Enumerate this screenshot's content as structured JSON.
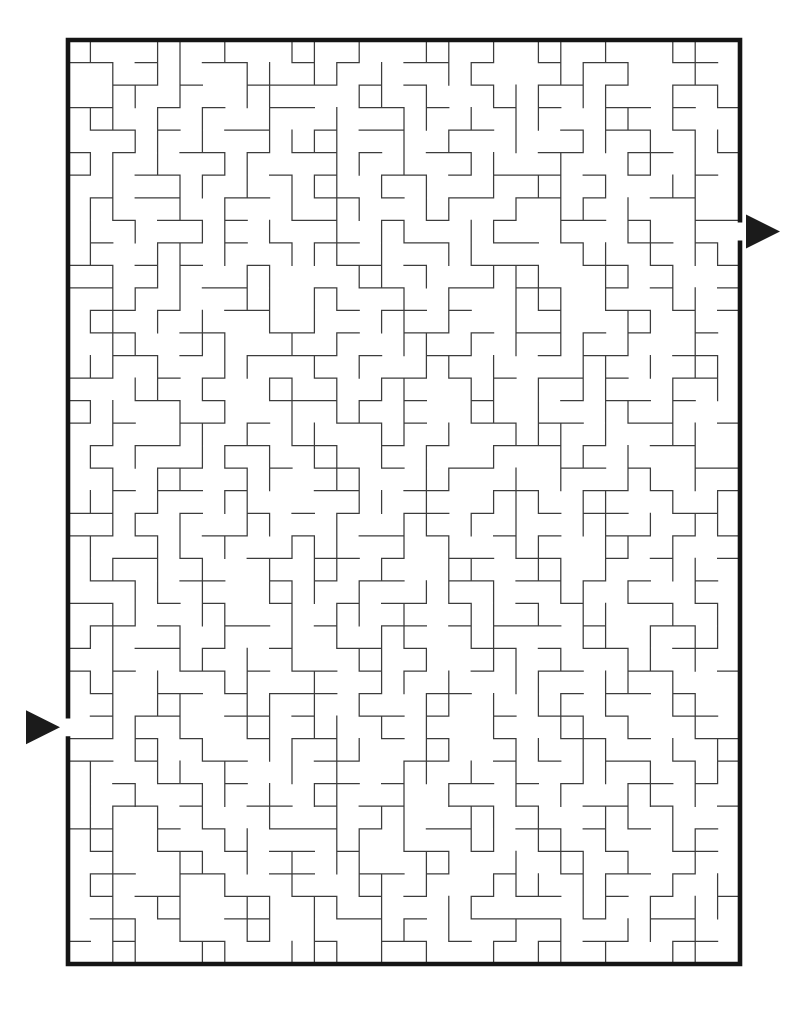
{
  "page": {
    "background": "#ffffff"
  },
  "maze": {
    "grid": {
      "cols": 30,
      "rows": 41
    },
    "frame": {
      "x": 68,
      "y": 40,
      "width": 672,
      "height": 924
    },
    "border": {
      "color": "#151515",
      "width": 4.6
    },
    "wall": {
      "color": "#3c3c3c",
      "width": 1.25
    },
    "entrance": {
      "side": "left",
      "row": 30,
      "direction": "right"
    },
    "exit": {
      "side": "right",
      "row": 8,
      "direction": "right"
    },
    "arrow_color": "#1b1b1b",
    "hwalls": [
      "110100110010100110100101100110",
      "001101001111010100100110100110",
      "110010100110011010010100110101",
      "011010011001011001100010110100",
      "101001101011010011000110011001",
      "100110100101001101011101010010",
      "010110011001101001101101001100",
      "001011010011001010010011010011",
      "010011010101100110011010011010",
      "110101001000110100111001101001",
      "110100110001011001101100101001",
      "011010011000101101000100110101",
      "011001100110100110101101010010",
      "001101001111010011000101100110",
      "110010100101001101010110100110",
      "100110100111010100100010110100",
      "101001101000110100110110011001",
      "010110011011001010011101001100",
      "010011010101101001100011010011",
      "001011010001100110011001101001",
      "110101001010100110100101100110",
      "110100110010011010010100110101",
      "001101001101101001101100101001",
      "011001100101011001101101010010",
      "110010100100101101001010011010",
      "011010011001001101011101001100",
      "100110100100110100110101100110",
      "101001101011010100100110011001",
      "010011010111010011000010110100",
      "010110011010011010010110100110",
      "110101001011001010010011010011",
      "110100110001100110010100110101",
      "001011010001101001101010011010",
      "001101001101011001101001101001",
      "110010100111010011001101010010",
      "010011010110100110100110100110",
      "011001100110011010010010110100",
      "010110011011010100101100101001",
      "011010011000110100111101001100",
      "101001101001001101010101100110"
    ],
    "vwalls": [
      "10011010011010011010110100110",
      "01011001101101001100011010010",
      "01101001100011010011101100101",
      "11010100100100110101100110100",
      "00110100111100101001001101011",
      "11010011000110100110010011010",
      "01001101011101010010110100110",
      "11001010010110011001011010010",
      "10100110100101100110010011010",
      "10011010011101001100001101011",
      "01011001100011010011100110100",
      "01101001101100101001110100110",
      "11010100101001101001010011010",
      "01100110010100110101011010010",
      "11010011001010011010001101011",
      "00110100110101100110101100101",
      "11001010010110100110100110100",
      "01001101011001101001110100110",
      "10100110101101010010011010010",
      "01011001100110011001010011010",
      "11010011000011010011101100101",
      "01101001100100110101001101011",
      "10011010011100101001100110100",
      "11010100101101001100110100110",
      "00110100111010011010011010010",
      "01100110010110100110101100101",
      "11001010010101100110001101011",
      "01001101010011010011010011010",
      "11010011001001101001100110100",
      "01011001101010011010110100110",
      "01101001101101010010011010010",
      "00110100110110011001101100101",
      "10011010010100110101001101011",
      "10100110101100101001010011010",
      "11010100100101100110100110100",
      "11010011000110100110110100110",
      "01001101010110011001011010010",
      "11001010010011010011101100101",
      "01011001101101001100001101011",
      "01101001101001101001010011010",
      "01100110011101010010110100110"
    ]
  }
}
